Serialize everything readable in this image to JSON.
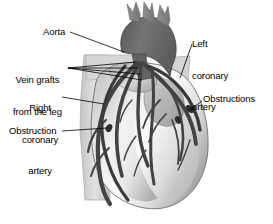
{
  "figure": {
    "background_color": "#ffffff",
    "text_color": "#000000",
    "width": 273,
    "height": 224
  },
  "labels": {
    "aorta": "Aorta",
    "vein_grafts_line1": "Vein grafts",
    "vein_grafts_line2": "from the leg",
    "right_coronary_line1": "Right",
    "right_coronary_line2": "coronary",
    "right_coronary_line3": "artery",
    "obstruction": "Obstruction",
    "left_coronary_line1": "Left",
    "left_coronary_line2": "coronary",
    "left_coronary_line3": "artery",
    "obstructions": "Obstructions"
  },
  "anatomy": {
    "aorta_color": "#6e6e6e",
    "aorta_branch_color": "#8d8d8d",
    "heart_body_light": "#fdfdfd",
    "heart_body_mid": "#d8d8d8",
    "heart_body_shadow": "#a9a9a9",
    "vessel_color": "#454545",
    "vessel_dark": "#2f2f2f",
    "vena_cava_color": "#d2d2d2",
    "outline_color": "#5a5a5a",
    "leader_line_color": "#000000"
  }
}
